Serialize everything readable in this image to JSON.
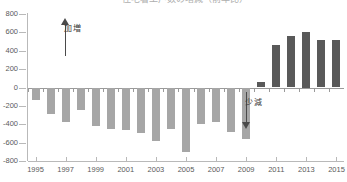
{
  "chart_data": {
    "type": "bar",
    "title": "住宅着工戸数の増減（前年比）",
    "xlabel": "",
    "ylabel": "",
    "ylim": [
      -800,
      800
    ],
    "ytick_step": 200,
    "ytick_labels": [
      "800",
      "600",
      "400",
      "200",
      "0",
      "-200",
      "-400",
      "-600",
      "-800"
    ],
    "ytick_values": [
      800,
      600,
      400,
      200,
      0,
      -200,
      -400,
      -600,
      -800
    ],
    "grid": false,
    "legend": "none",
    "categories": [
      "1995",
      "1996",
      "1997",
      "1998",
      "1999",
      "2000",
      "2001",
      "2002",
      "2003",
      "2004",
      "2005",
      "2006",
      "2007",
      "2008",
      "2009",
      "2010",
      "2011",
      "2012",
      "2013",
      "2014",
      "2015"
    ],
    "xtick_labels": [
      "1995",
      "1997",
      "1999",
      "2001",
      "2003",
      "2005",
      "2007",
      "2009",
      "2011",
      "2013",
      "2015"
    ],
    "values": [
      -140,
      -290,
      -380,
      -250,
      -420,
      -450,
      -460,
      -500,
      -580,
      -450,
      -700,
      -400,
      -380,
      -480,
      -560,
      60,
      460,
      560,
      600,
      520,
      520
    ],
    "positive_color": "#595959",
    "negative_color": "#a6a6a6",
    "annotations": [
      {
        "name": "increase",
        "text": "増加",
        "direction": "up"
      },
      {
        "name": "decrease",
        "text": "減少",
        "direction": "down"
      }
    ]
  }
}
